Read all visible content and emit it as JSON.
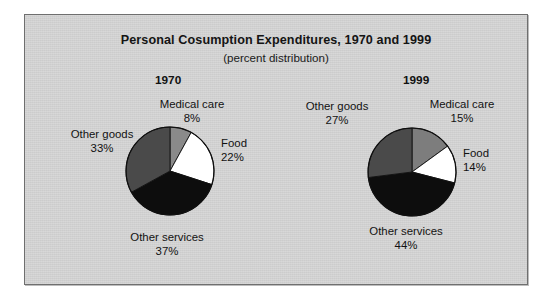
{
  "figure": {
    "title": "Personal Cosumption Expenditures, 1970 and 1999",
    "subtitle": "(percent distribution)",
    "background_color": "#d3d3d3",
    "page_color": "#ffffff",
    "border_color": "#6f6f6f"
  },
  "chart_data": {
    "type": "pie",
    "title": "Personal Cosumption Expenditures, 1970 and 1999",
    "subtitle": "(percent distribution)",
    "units": "percent",
    "grid": false,
    "legend": "none",
    "labels_position": "outside-callout",
    "start_angle_deg": 0,
    "direction": "clockwise",
    "charts": [
      {
        "name": "1970",
        "year_label": "1970",
        "slices": [
          {
            "label": "Medical care",
            "value": 8,
            "value_label": "8%",
            "color": "#8a8a8a"
          },
          {
            "label": "Food",
            "value": 22,
            "value_label": "22%",
            "color": "#ffffff"
          },
          {
            "label": "Other services",
            "value": 37,
            "value_label": "37%",
            "color": "#0d0d0d"
          },
          {
            "label": "Other goods",
            "value": 33,
            "value_label": "33%",
            "color": "#4a4a4a"
          }
        ]
      },
      {
        "name": "1999",
        "year_label": "1999",
        "slices": [
          {
            "label": "Medical care",
            "value": 15,
            "value_label": "15%",
            "color": "#7d7d7d"
          },
          {
            "label": "Food",
            "value": 14,
            "value_label": "14%",
            "color": "#ffffff"
          },
          {
            "label": "Other services",
            "value": 44,
            "value_label": "44%",
            "color": "#0d0d0d"
          },
          {
            "label": "Other goods",
            "value": 27,
            "value_label": "27%",
            "color": "#4a4a4a"
          }
        ]
      }
    ]
  }
}
